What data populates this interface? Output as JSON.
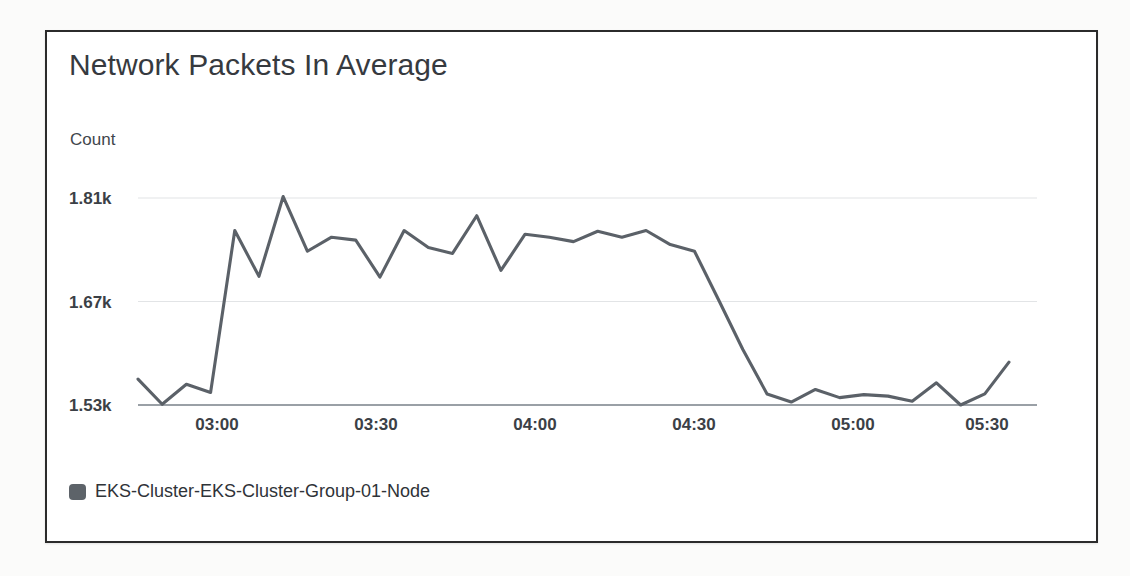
{
  "widget": {
    "title": "Network Packets In Average",
    "y_axis_unit": "Count",
    "legend": {
      "marker": "series-color-swatch",
      "label": "EKS-Cluster-EKS-Cluster-Group-01-Node"
    }
  },
  "chart_data": {
    "type": "line",
    "title": "Network Packets In Average",
    "xlabel": "",
    "ylabel": "Count",
    "ylim": [
      1530,
      1850
    ],
    "yticks": [
      1530,
      1670,
      1810
    ],
    "ytick_labels": [
      "1.53k",
      "1.67k",
      "1.81k"
    ],
    "xticks": [
      "03:00",
      "03:30",
      "04:00",
      "04:30",
      "05:00",
      "05:30"
    ],
    "grid": true,
    "legend_position": "bottom-left",
    "series": [
      {
        "name": "EKS-Cluster-EKS-Cluster-Group-01-Node",
        "color": "#5b6168",
        "x": [
          "02:41",
          "02:46",
          "02:51",
          "02:56",
          "03:01",
          "03:06",
          "03:11",
          "03:16",
          "03:21",
          "03:26",
          "03:31",
          "03:36",
          "03:41",
          "03:46",
          "03:51",
          "03:56",
          "04:01",
          "04:06",
          "04:11",
          "04:16",
          "04:21",
          "04:26",
          "04:31",
          "04:36",
          "04:41",
          "04:46",
          "04:51",
          "04:56",
          "05:01",
          "05:06",
          "05:11",
          "05:16",
          "05:21",
          "05:26",
          "05:31",
          "05:36",
          "05:41"
        ],
        "values": [
          1565,
          1531,
          1558,
          1547,
          1766,
          1704,
          1812,
          1738,
          1757,
          1753,
          1703,
          1766,
          1743,
          1735,
          1786,
          1712,
          1761,
          1757,
          1751,
          1765,
          1757,
          1766,
          1747,
          1738,
          1672,
          1605,
          1545,
          1534,
          1551,
          1540,
          1544,
          1542,
          1535,
          1560,
          1530,
          1545,
          1588
        ]
      }
    ]
  }
}
